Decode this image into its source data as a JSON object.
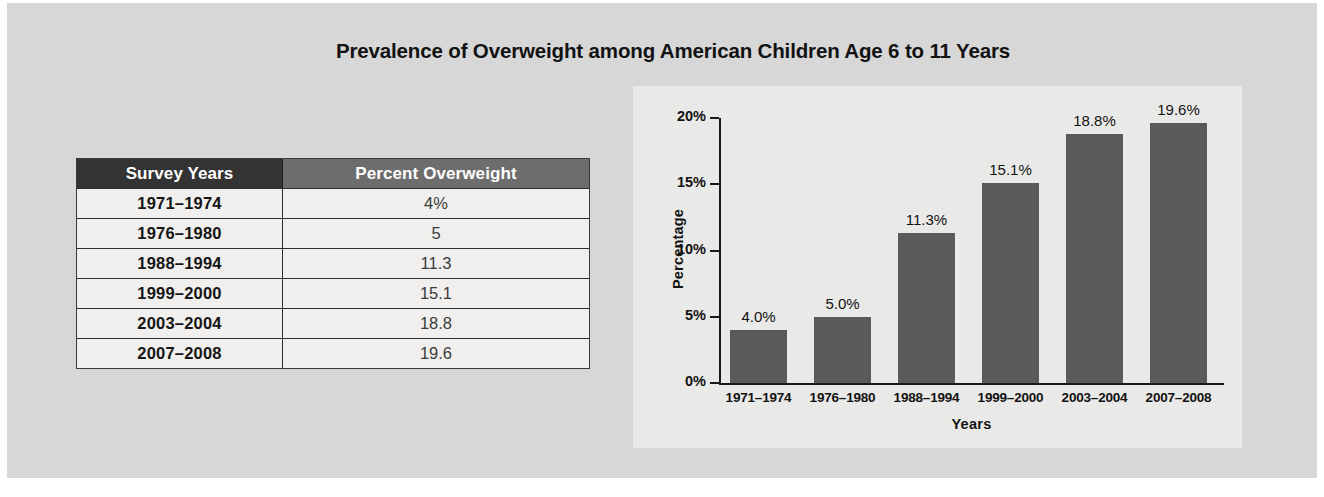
{
  "figure": {
    "title": "Prevalence of Overweight among American Children Age 6 to 11 Years"
  },
  "table": {
    "headers": [
      "Survey Years",
      "Percent Overweight"
    ],
    "rows": [
      {
        "years": "1971–1974",
        "percent": "4%"
      },
      {
        "years": "1976–1980",
        "percent": "5"
      },
      {
        "years": "1988–1994",
        "percent": "11.3"
      },
      {
        "years": "1999–2000",
        "percent": "15.1"
      },
      {
        "years": "2003–2004",
        "percent": "18.8"
      },
      {
        "years": "2007–2008",
        "percent": "19.6"
      }
    ]
  },
  "chart_data": {
    "type": "bar",
    "title": "Prevalence of Overweight among American Children Age 6 to 11 Years",
    "xlabel": "Years",
    "ylabel": "Percentage",
    "categories": [
      "1971–1974",
      "1976–1980",
      "1988–1994",
      "1999–2000",
      "2003–2004",
      "2007–2008"
    ],
    "values": [
      4.0,
      5.0,
      11.3,
      15.1,
      18.8,
      19.6
    ],
    "data_labels": [
      "4.0%",
      "5.0%",
      "11.3%",
      "15.1%",
      "18.8%",
      "19.6%"
    ],
    "ylim": [
      0,
      20
    ],
    "yticks": [
      0,
      5,
      10,
      15,
      20
    ],
    "ytick_labels": [
      "0%",
      "5%",
      "10%",
      "15%",
      "20%"
    ],
    "grid": false,
    "legend": false,
    "bar_color": "#5a5a5a",
    "panel_color": "#e9e9e7"
  },
  "colors": {
    "page_background": "#d7d7d7",
    "header_dark": "#333333",
    "header_gray": "#6d6d6d",
    "row_background": "#f0efed",
    "bar": "#5a5a5a",
    "axis": "#1a1a1a"
  }
}
